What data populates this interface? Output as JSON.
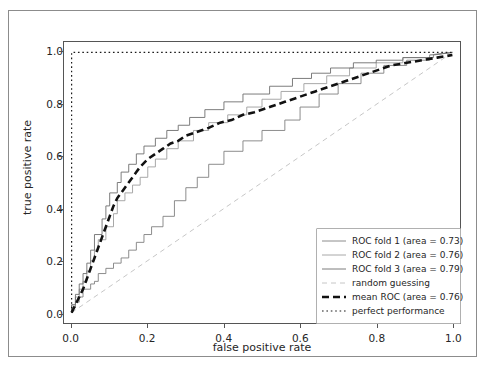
{
  "chart_data": {
    "type": "line",
    "title": "",
    "xlabel": "false positive rate",
    "ylabel": "true positive rate",
    "xlim": [
      -0.02,
      1.02
    ],
    "ylim": [
      -0.04,
      1.04
    ],
    "xticks": [
      "0.0",
      "0.2",
      "0.4",
      "0.6",
      "0.8",
      "1.0"
    ],
    "yticks": [
      "0.0",
      "0.2",
      "0.4",
      "0.6",
      "0.8",
      "1.0"
    ],
    "xtick_values": [
      0.0,
      0.2,
      0.4,
      0.6,
      0.8,
      1.0
    ],
    "ytick_values": [
      0.0,
      0.2,
      0.4,
      0.6,
      0.8,
      1.0
    ],
    "grid": false,
    "legend_position": "lower right",
    "colors": {
      "fold1": "#7f7f7f",
      "fold2": "#9e9e9e",
      "fold3": "#6e6e6e",
      "random_guessing": "#bfbfbf",
      "mean_roc": "#111111",
      "perfect_performance": "#1a1a1a",
      "axis": "#555555",
      "frame": "#8c8c8c",
      "text": "#262626",
      "background": "#ffffff"
    },
    "series": [
      {
        "name": "ROC fold 1 (area = 0.73)",
        "key": "fold1",
        "style": "solid",
        "width": 0.9,
        "area": 0.73,
        "x": [
          0.0,
          0.0,
          0.01,
          0.01,
          0.02,
          0.02,
          0.03,
          0.03,
          0.05,
          0.05,
          0.06,
          0.06,
          0.07,
          0.07,
          0.09,
          0.09,
          0.11,
          0.11,
          0.13,
          0.13,
          0.15,
          0.15,
          0.17,
          0.17,
          0.19,
          0.19,
          0.21,
          0.21,
          0.24,
          0.24,
          0.27,
          0.27,
          0.3,
          0.3,
          0.33,
          0.33,
          0.36,
          0.36,
          0.4,
          0.4,
          0.45,
          0.45,
          0.5,
          0.5,
          0.56,
          0.56,
          0.6,
          0.6,
          0.65,
          0.65,
          0.7,
          0.7,
          0.76,
          0.76,
          0.82,
          0.82,
          0.88,
          0.88,
          0.94,
          0.94,
          1.0
        ],
        "y": [
          0.0,
          0.02,
          0.02,
          0.04,
          0.04,
          0.06,
          0.06,
          0.09,
          0.09,
          0.11,
          0.11,
          0.12,
          0.12,
          0.15,
          0.15,
          0.17,
          0.17,
          0.19,
          0.19,
          0.21,
          0.21,
          0.24,
          0.24,
          0.27,
          0.27,
          0.3,
          0.3,
          0.33,
          0.33,
          0.37,
          0.37,
          0.43,
          0.43,
          0.48,
          0.48,
          0.52,
          0.52,
          0.57,
          0.57,
          0.62,
          0.62,
          0.66,
          0.66,
          0.7,
          0.7,
          0.74,
          0.74,
          0.79,
          0.79,
          0.84,
          0.84,
          0.88,
          0.88,
          0.92,
          0.92,
          0.95,
          0.95,
          0.97,
          0.97,
          0.99,
          1.0
        ]
      },
      {
        "name": "ROC fold 2 (area = 0.76)",
        "key": "fold2",
        "style": "solid",
        "width": 0.9,
        "area": 0.76,
        "x": [
          0.0,
          0.0,
          0.01,
          0.01,
          0.02,
          0.02,
          0.03,
          0.03,
          0.04,
          0.04,
          0.05,
          0.05,
          0.06,
          0.06,
          0.07,
          0.07,
          0.09,
          0.09,
          0.11,
          0.11,
          0.12,
          0.12,
          0.14,
          0.14,
          0.16,
          0.16,
          0.18,
          0.18,
          0.2,
          0.2,
          0.22,
          0.22,
          0.25,
          0.25,
          0.28,
          0.28,
          0.32,
          0.32,
          0.36,
          0.36,
          0.41,
          0.41,
          0.46,
          0.46,
          0.5,
          0.5,
          0.55,
          0.55,
          0.61,
          0.61,
          0.67,
          0.67,
          0.73,
          0.73,
          0.8,
          0.8,
          0.87,
          0.87,
          0.94,
          0.94,
          1.0
        ],
        "y": [
          0.0,
          0.03,
          0.03,
          0.06,
          0.06,
          0.09,
          0.09,
          0.12,
          0.12,
          0.16,
          0.16,
          0.2,
          0.2,
          0.24,
          0.24,
          0.28,
          0.28,
          0.33,
          0.33,
          0.38,
          0.38,
          0.43,
          0.43,
          0.46,
          0.46,
          0.49,
          0.49,
          0.52,
          0.52,
          0.56,
          0.56,
          0.59,
          0.59,
          0.63,
          0.63,
          0.66,
          0.66,
          0.7,
          0.7,
          0.73,
          0.73,
          0.76,
          0.76,
          0.79,
          0.79,
          0.82,
          0.82,
          0.85,
          0.85,
          0.88,
          0.88,
          0.91,
          0.91,
          0.94,
          0.94,
          0.96,
          0.96,
          0.98,
          0.98,
          0.99,
          1.0
        ]
      },
      {
        "name": "ROC fold 3 (area = 0.79)",
        "key": "fold3",
        "style": "solid",
        "width": 0.9,
        "area": 0.79,
        "x": [
          0.0,
          0.0,
          0.01,
          0.01,
          0.02,
          0.02,
          0.03,
          0.03,
          0.04,
          0.04,
          0.05,
          0.05,
          0.06,
          0.06,
          0.08,
          0.08,
          0.09,
          0.09,
          0.1,
          0.1,
          0.12,
          0.12,
          0.13,
          0.13,
          0.15,
          0.15,
          0.17,
          0.17,
          0.19,
          0.19,
          0.22,
          0.22,
          0.25,
          0.25,
          0.28,
          0.28,
          0.31,
          0.31,
          0.35,
          0.35,
          0.4,
          0.4,
          0.45,
          0.45,
          0.52,
          0.52,
          0.58,
          0.58,
          0.63,
          0.63,
          0.68,
          0.68,
          0.74,
          0.74,
          0.8,
          0.8,
          0.87,
          0.87,
          0.95,
          0.95,
          1.0
        ],
        "y": [
          0.0,
          0.03,
          0.03,
          0.07,
          0.07,
          0.11,
          0.11,
          0.15,
          0.15,
          0.19,
          0.19,
          0.24,
          0.24,
          0.3,
          0.3,
          0.36,
          0.36,
          0.41,
          0.41,
          0.46,
          0.46,
          0.5,
          0.5,
          0.54,
          0.54,
          0.57,
          0.57,
          0.61,
          0.61,
          0.64,
          0.64,
          0.67,
          0.67,
          0.7,
          0.7,
          0.72,
          0.72,
          0.75,
          0.75,
          0.78,
          0.78,
          0.81,
          0.81,
          0.84,
          0.84,
          0.87,
          0.87,
          0.9,
          0.9,
          0.92,
          0.92,
          0.94,
          0.94,
          0.96,
          0.96,
          0.97,
          0.97,
          0.98,
          0.98,
          0.99,
          1.0
        ]
      },
      {
        "name": "random guessing",
        "key": "random_guessing",
        "style": "dashed",
        "width": 0.9,
        "x": [
          0.0,
          1.0
        ],
        "y": [
          0.0,
          1.0
        ]
      },
      {
        "name": "mean ROC (area = 0.76)",
        "key": "mean_roc",
        "style": "dashed-thick",
        "width": 2.6,
        "area": 0.76,
        "x": [
          0.0,
          0.01,
          0.02,
          0.03,
          0.04,
          0.05,
          0.06,
          0.07,
          0.08,
          0.09,
          0.1,
          0.11,
          0.12,
          0.13,
          0.14,
          0.15,
          0.16,
          0.17,
          0.18,
          0.2,
          0.22,
          0.24,
          0.26,
          0.28,
          0.3,
          0.32,
          0.34,
          0.36,
          0.39,
          0.42,
          0.45,
          0.48,
          0.52,
          0.56,
          0.6,
          0.64,
          0.68,
          0.72,
          0.76,
          0.8,
          0.84,
          0.88,
          0.92,
          0.96,
          1.0
        ],
        "y": [
          0.0,
          0.03,
          0.06,
          0.09,
          0.13,
          0.17,
          0.21,
          0.25,
          0.29,
          0.33,
          0.37,
          0.41,
          0.44,
          0.46,
          0.48,
          0.5,
          0.52,
          0.54,
          0.56,
          0.59,
          0.61,
          0.63,
          0.65,
          0.66,
          0.68,
          0.69,
          0.7,
          0.71,
          0.73,
          0.74,
          0.76,
          0.77,
          0.79,
          0.81,
          0.83,
          0.85,
          0.87,
          0.89,
          0.91,
          0.93,
          0.95,
          0.96,
          0.97,
          0.98,
          0.99
        ]
      },
      {
        "name": "perfect performance",
        "key": "perfect_performance",
        "style": "dotted",
        "width": 1.2,
        "x": [
          0.0,
          0.0,
          1.0
        ],
        "y": [
          0.0,
          1.0,
          1.0
        ]
      }
    ]
  },
  "legend": {
    "items": [
      {
        "label": "ROC fold 1 (area = 0.73)",
        "key": "fold1"
      },
      {
        "label": "ROC fold 2 (area = 0.76)",
        "key": "fold2"
      },
      {
        "label": "ROC fold 3 (area = 0.79)",
        "key": "fold3"
      },
      {
        "label": "random guessing",
        "key": "random_guessing"
      },
      {
        "label": "mean ROC (area = 0.76)",
        "key": "mean_roc"
      },
      {
        "label": "perfect performance",
        "key": "perfect_performance"
      }
    ]
  }
}
